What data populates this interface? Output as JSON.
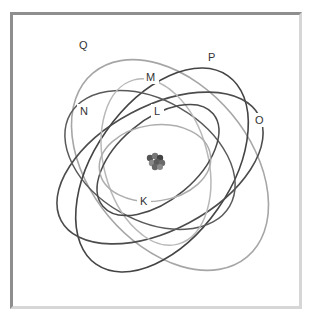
{
  "diagram": {
    "nucleus": {
      "label": "",
      "cx": 156,
      "cy": 162
    },
    "shells": [
      {
        "id": "K",
        "label": "K",
        "lx": 144,
        "ly": 204,
        "color": "#a8a8a8"
      },
      {
        "id": "L",
        "label": "L",
        "lx": 157,
        "ly": 114,
        "color": "#4a4a4a"
      },
      {
        "id": "M",
        "label": "M",
        "lx": 151,
        "ly": 79,
        "color": "#b4b4b4"
      },
      {
        "id": "N",
        "label": "N",
        "lx": 84,
        "ly": 113,
        "color": "#5a5a5a"
      },
      {
        "id": "O",
        "label": "O",
        "lx": 260,
        "ly": 122,
        "color": "#4a4a4a"
      },
      {
        "id": "P",
        "label": "P",
        "lx": 212,
        "ly": 59,
        "color": "#3e3e3e"
      },
      {
        "id": "Q",
        "label": "Q",
        "lx": 84,
        "ly": 47,
        "color": "#9c9c9c"
      }
    ]
  }
}
